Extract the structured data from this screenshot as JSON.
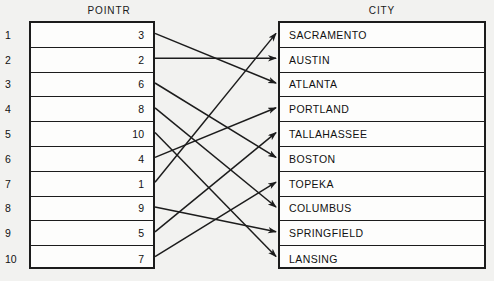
{
  "diagram": {
    "type": "pointer-array-mapping",
    "pointr": {
      "title": "POINTR",
      "indices": [
        1,
        2,
        3,
        4,
        5,
        6,
        7,
        8,
        9,
        10
      ],
      "values": [
        3,
        2,
        6,
        8,
        10,
        4,
        1,
        9,
        5,
        7
      ]
    },
    "city": {
      "title": "CITY",
      "indices": [
        1,
        2,
        3,
        4,
        5,
        6,
        7,
        8,
        9,
        10
      ],
      "values": [
        "SACRAMENTO",
        "AUSTIN",
        "ATLANTA",
        "PORTLAND",
        "TALLAHASSEE",
        "BOSTON",
        "TOPEKA",
        "COLUMBUS",
        "SPRINGFIELD",
        "LANSING"
      ]
    },
    "links": [
      {
        "from_row": 1,
        "to_row": 3,
        "to_city": "ATLANTA"
      },
      {
        "from_row": 2,
        "to_row": 2,
        "to_city": "AUSTIN"
      },
      {
        "from_row": 3,
        "to_row": 6,
        "to_city": "BOSTON"
      },
      {
        "from_row": 4,
        "to_row": 8,
        "to_city": "COLUMBUS"
      },
      {
        "from_row": 5,
        "to_row": 10,
        "to_city": "LANSING"
      },
      {
        "from_row": 6,
        "to_row": 4,
        "to_city": "PORTLAND"
      },
      {
        "from_row": 7,
        "to_row": 1,
        "to_city": "SACRAMENTO"
      },
      {
        "from_row": 8,
        "to_row": 9,
        "to_city": "SPRINGFIELD"
      },
      {
        "from_row": 9,
        "to_row": 5,
        "to_city": "TALLAHASSEE"
      },
      {
        "from_row": 10,
        "to_row": 7,
        "to_city": "TOPEKA"
      }
    ],
    "colors": {
      "background": "#f2f2f0",
      "box_fill": "#fdfdfc",
      "line": "#1c1c1c",
      "text": "#111111"
    }
  }
}
